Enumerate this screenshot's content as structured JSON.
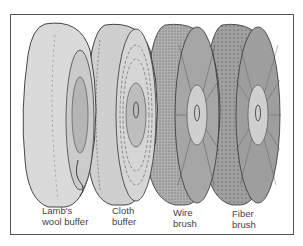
{
  "figure": {
    "wheels": [
      {
        "id": "lambs-wool",
        "label_line1": "Lamb's",
        "label_line2": "wool buffer",
        "fill": "#d9d9d9"
      },
      {
        "id": "cloth",
        "label_line1": "Cloth",
        "label_line2": "buffer",
        "fill": "#cfcfcf"
      },
      {
        "id": "wire",
        "label_line1": "Wire",
        "label_line2": "brush",
        "fill": "#a8a8a8"
      },
      {
        "id": "fiber",
        "label_line1": "Fiber",
        "label_line2": "brush",
        "fill": "#9a9a9a"
      }
    ],
    "colors": {
      "outline": "#333333",
      "border": "#555555",
      "hub": "#c4c4c4"
    }
  }
}
